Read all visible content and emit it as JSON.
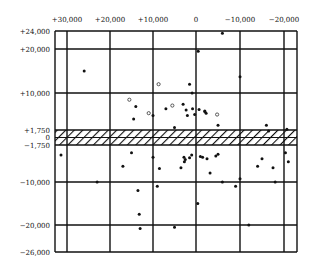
{
  "chart_data": {
    "type": "scatter",
    "title": "",
    "xlabel": "",
    "ylabel": "",
    "grid": true,
    "legend": null,
    "xlim": [
      33000,
      -29000
    ],
    "ylim": [
      -26000,
      24000
    ],
    "x_tick_labels": [
      "+30,000",
      "+20,000",
      "+10,000",
      "0",
      "−10,000",
      "−20,000"
    ],
    "x_ticks": [
      30000,
      20000,
      10000,
      0,
      -10000,
      -20000
    ],
    "y_tick_labels": [
      "+24,000",
      "+20,000",
      "+10,000",
      "+1,750",
      "0",
      "−1,750",
      "−10,000",
      "−20,000",
      "−26,000"
    ],
    "y_ticks": [
      24000,
      20000,
      10000,
      1750,
      0,
      -1750,
      -10000,
      -20000,
      -26000
    ],
    "shaded_band": {
      "y_from": -1750,
      "y_to": 1750,
      "pattern": "diagonal-hatch"
    },
    "points_filled": [
      [
        26000,
        15000
      ],
      [
        14000,
        7000
      ],
      [
        14500,
        4200
      ],
      [
        10000,
        5000
      ],
      [
        3000,
        7500
      ],
      [
        2300,
        6200
      ],
      [
        2000,
        5000
      ],
      [
        800,
        6500
      ],
      [
        300,
        5200
      ],
      [
        -2000,
        6000
      ],
      [
        -6000,
        23500
      ],
      [
        -500,
        19500
      ],
      [
        1500,
        12000
      ],
      [
        900,
        10000
      ],
      [
        -700,
        6300
      ],
      [
        -2000,
        5900
      ],
      [
        -2300,
        5500
      ],
      [
        -5000,
        2800
      ],
      [
        -10000,
        13700
      ],
      [
        -16000,
        2800
      ],
      [
        -16500,
        1500
      ],
      [
        -22000,
        1900
      ],
      [
        5000,
        2300
      ],
      [
        7000,
        6500
      ],
      [
        31500,
        -4000
      ],
      [
        23000,
        -10000
      ],
      [
        15000,
        -3500
      ],
      [
        17000,
        -6500
      ],
      [
        10000,
        -4500
      ],
      [
        8500,
        -7000
      ],
      [
        13500,
        -12000
      ],
      [
        13200,
        -17500
      ],
      [
        9000,
        -11000
      ],
      [
        2800,
        -4500
      ],
      [
        2500,
        -5000
      ],
      [
        2700,
        -5500
      ],
      [
        1500,
        -4600
      ],
      [
        1000,
        -4000
      ],
      [
        -1500,
        -4500
      ],
      [
        -2500,
        -4800
      ],
      [
        -5000,
        -3800
      ],
      [
        -4500,
        -4200
      ],
      [
        3500,
        -6800
      ],
      [
        -3200,
        -8000
      ],
      [
        -9000,
        -11000
      ],
      [
        -10000,
        -9300
      ],
      [
        -14000,
        -6500
      ],
      [
        -15000,
        -4800
      ],
      [
        -17500,
        -6800
      ],
      [
        -18000,
        -10000
      ],
      [
        -21000,
        -3500
      ],
      [
        -23000,
        -5500
      ],
      [
        -12000,
        -20000
      ],
      [
        5000,
        -20500
      ],
      [
        13000,
        -20800
      ],
      [
        -400,
        -15000
      ],
      [
        -1000,
        -4300
      ],
      [
        -6000,
        -10000
      ]
    ],
    "points_open": [
      [
        15500,
        8500
      ],
      [
        11000,
        5500
      ],
      [
        8700,
        12000
      ],
      [
        5500,
        7200
      ],
      [
        -4800,
        5200
      ]
    ]
  }
}
